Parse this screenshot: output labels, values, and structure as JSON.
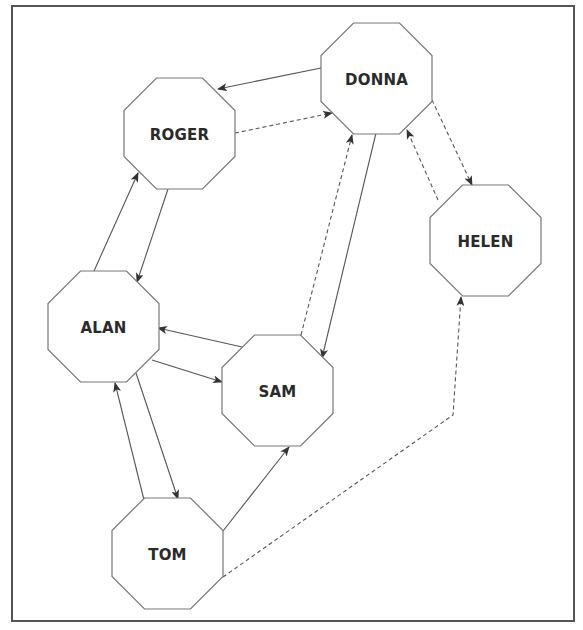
{
  "diagram": {
    "type": "directed-graph",
    "colors": {
      "frame": "#555555",
      "node_stroke": "#777777",
      "node_fill": "#ffffff",
      "edge": "#555555",
      "label": "#2a2a2a"
    },
    "nodes": [
      {
        "id": "roger",
        "label": "ROGER",
        "x": 124,
        "y": 78,
        "size": 111
      },
      {
        "id": "donna",
        "label": "DONNA",
        "x": 321,
        "y": 23,
        "size": 111
      },
      {
        "id": "helen",
        "label": "HELEN",
        "x": 430,
        "y": 185,
        "size": 111
      },
      {
        "id": "alan",
        "label": "ALAN",
        "x": 48,
        "y": 271,
        "size": 111
      },
      {
        "id": "sam",
        "label": "SAM",
        "x": 222,
        "y": 335,
        "size": 111
      },
      {
        "id": "tom",
        "label": "TOM",
        "x": 112,
        "y": 498,
        "size": 111
      }
    ],
    "edges": [
      {
        "from": "donna",
        "to": "roger",
        "style": "solid",
        "points": [
          [
            321,
            68
          ],
          [
            218,
            89
          ]
        ]
      },
      {
        "from": "roger",
        "to": "donna",
        "style": "dashed",
        "points": [
          [
            235,
            133
          ],
          [
            332,
            113
          ]
        ]
      },
      {
        "from": "alan",
        "to": "roger",
        "style": "solid",
        "points": [
          [
            94,
            271
          ],
          [
            138,
            173
          ]
        ]
      },
      {
        "from": "roger",
        "to": "alan",
        "style": "solid",
        "points": [
          [
            168,
            189
          ],
          [
            137,
            282
          ]
        ]
      },
      {
        "from": "sam",
        "to": "donna",
        "style": "dashed",
        "points": [
          [
            301,
            335
          ],
          [
            352,
            135
          ]
        ]
      },
      {
        "from": "donna",
        "to": "sam",
        "style": "solid",
        "points": [
          [
            376,
            133
          ],
          [
            322,
            358
          ]
        ]
      },
      {
        "from": "donna",
        "to": "helen",
        "style": "dashed",
        "points": [
          [
            432,
            100
          ],
          [
            472,
            185
          ]
        ]
      },
      {
        "from": "helen",
        "to": "donna",
        "style": "dashed",
        "points": [
          [
            438,
            200
          ],
          [
            407,
            130
          ]
        ]
      },
      {
        "from": "sam",
        "to": "alan",
        "style": "solid",
        "points": [
          [
            242,
            347
          ],
          [
            158,
            328
          ]
        ]
      },
      {
        "from": "alan",
        "to": "sam",
        "style": "solid",
        "points": [
          [
            152,
            360
          ],
          [
            222,
            382
          ]
        ]
      },
      {
        "from": "tom",
        "to": "alan",
        "style": "solid",
        "points": [
          [
            144,
            500
          ],
          [
            115,
            383
          ]
        ]
      },
      {
        "from": "alan",
        "to": "tom",
        "style": "solid",
        "points": [
          [
            136,
            373
          ],
          [
            178,
            499
          ]
        ]
      },
      {
        "from": "tom",
        "to": "sam",
        "style": "solid",
        "points": [
          [
            223,
            531
          ],
          [
            289,
            447
          ]
        ]
      },
      {
        "from": "tom",
        "to": "helen",
        "style": "dashed",
        "points": [
          [
            223,
            577
          ],
          [
            453,
            415
          ],
          [
            461,
            297
          ]
        ]
      }
    ]
  }
}
